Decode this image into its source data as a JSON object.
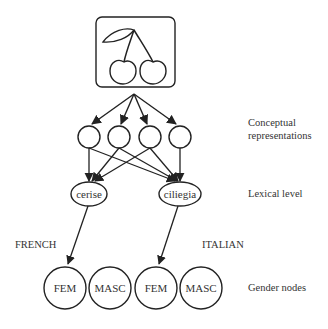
{
  "diagram": {
    "picture": {
      "icon": "cherries-icon"
    },
    "levels": {
      "conceptual": "Conceptual representations",
      "conceptual_line1": "Conceptual",
      "conceptual_line2": "representations",
      "lexical": "Lexical level",
      "gender": "Gender nodes"
    },
    "languages": {
      "french": "FRENCH",
      "italian": "ITALIAN"
    },
    "lexical_nodes": [
      {
        "word": "cerise",
        "language": "French"
      },
      {
        "word": "ciliegia",
        "language": "Italian"
      }
    ],
    "gender_nodes": [
      {
        "label": "FEM",
        "language": "French"
      },
      {
        "label": "MASC",
        "language": "French"
      },
      {
        "label": "FEM",
        "language": "Italian"
      },
      {
        "label": "MASC",
        "language": "Italian"
      }
    ],
    "concept_node_count": 4,
    "colors": {
      "stroke": "#222222",
      "background": "#ffffff"
    }
  }
}
